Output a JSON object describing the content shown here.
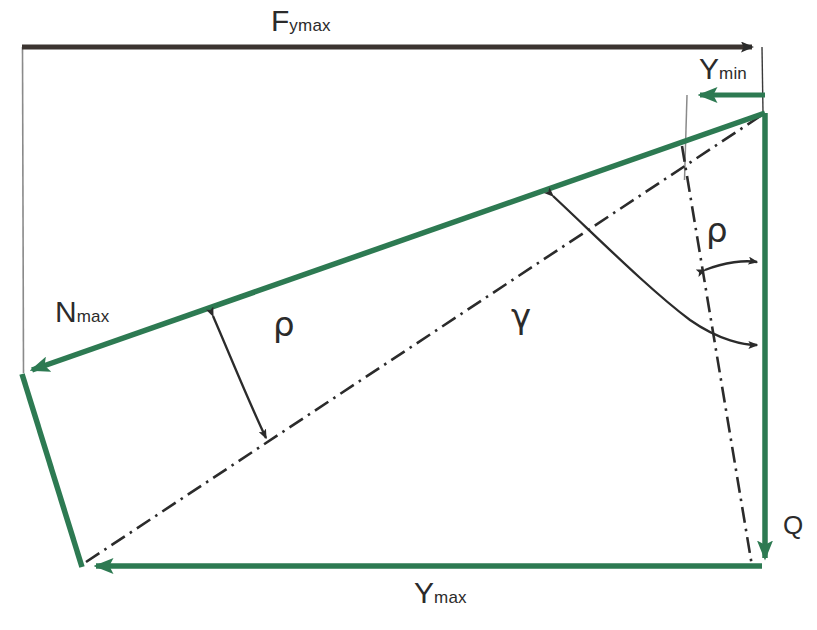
{
  "figure": {
    "type": "vector-force-diagram",
    "background_color": "#ffffff",
    "colors": {
      "vector_green": "#2d7a52",
      "line_dark": "#2b2b2b",
      "thin_gray": "#7a7a7a"
    }
  },
  "labels": {
    "f_ymax": {
      "base": "F",
      "sub": "ymax"
    },
    "y_min": {
      "base": "Y",
      "sub": "min"
    },
    "y_max": {
      "base": "Y",
      "sub": "max"
    },
    "n_max": {
      "base": "N",
      "sub": "max"
    },
    "rho_left": "ρ",
    "rho_right": "ρ",
    "gamma": "γ",
    "q": "Q"
  },
  "geometry": {
    "top_arrow": {
      "x1": 22,
      "y1": 47,
      "x2": 758,
      "y2": 47,
      "color": "#2b2b2b",
      "label": "F_ymax"
    },
    "ymin_arrow": {
      "x1": 765,
      "y1": 95,
      "x2": 692,
      "y2": 95,
      "color": "#2d7a52",
      "label": "Y_min"
    },
    "ymax_arrow": {
      "x1": 762,
      "y1": 566,
      "x2": 90,
      "y2": 566,
      "color": "#2d7a52",
      "label": "Y_max"
    },
    "nmax_arrow": {
      "x1": 765,
      "y1": 113,
      "x2": 27,
      "y2": 372,
      "color": "#2d7a52",
      "label": "N_max"
    },
    "q_arrow": {
      "x1": 765,
      "y1": 113,
      "x2": 765,
      "y2": 566,
      "color": "#2d7a52",
      "label": "Q"
    },
    "left_edge": {
      "x1": 22,
      "y1": 375,
      "x2": 82,
      "y2": 566,
      "color": "#2d7a52"
    },
    "thin_vertical_left": {
      "x1": 22,
      "y1": 47,
      "x2": 22,
      "y2": 372,
      "color": "#7a7a7a"
    },
    "thin_vertical_right": {
      "x1": 762,
      "y1": 47,
      "x2": 762,
      "y2": 112,
      "color": "#2b2b2b"
    },
    "thin_drop": {
      "x1": 686,
      "y1": 95,
      "x2": 684,
      "y2": 178,
      "color": "#7a7a7a"
    },
    "dashdot_main": {
      "x1": 86,
      "y1": 562,
      "x2": 764,
      "y2": 114,
      "style": "dash-dot"
    },
    "dashdot_right": {
      "x1": 684,
      "y1": 150,
      "x2": 752,
      "y2": 560,
      "style": "dash-dot"
    }
  },
  "angles": {
    "rho_left": {
      "label": "ρ",
      "between": [
        "N_max",
        "dashdot_main"
      ],
      "arrow_ends": "both"
    },
    "rho_right": {
      "label": "ρ",
      "between": [
        "dashdot_right",
        "Q"
      ],
      "arrow_ends": "both"
    },
    "gamma": {
      "label": "γ",
      "between": [
        "N_max",
        "Q"
      ],
      "arrow_ends": "both"
    }
  }
}
